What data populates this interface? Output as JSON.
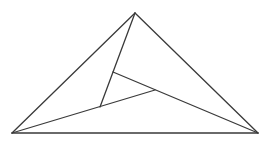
{
  "diagram": {
    "type": "geometric-figure",
    "stroke_color": "#3a3a3a",
    "background": "#ffffff",
    "points": {
      "A": [
        135,
        13
      ],
      "B": [
        12,
        133
      ],
      "C": [
        258,
        133
      ],
      "P": [
        113,
        72
      ],
      "Q": [
        155,
        90
      ],
      "R": [
        100,
        107
      ]
    },
    "segments": [
      {
        "id": "AB",
        "from": "A",
        "to": "B"
      },
      {
        "id": "AC",
        "from": "A",
        "to": "C"
      },
      {
        "id": "BC",
        "from": "B",
        "to": "C"
      },
      {
        "id": "AR",
        "from": "A",
        "to": "R"
      },
      {
        "id": "BQ",
        "from": "B",
        "to": "Q"
      },
      {
        "id": "PC",
        "from": "P",
        "to": "C"
      }
    ]
  }
}
